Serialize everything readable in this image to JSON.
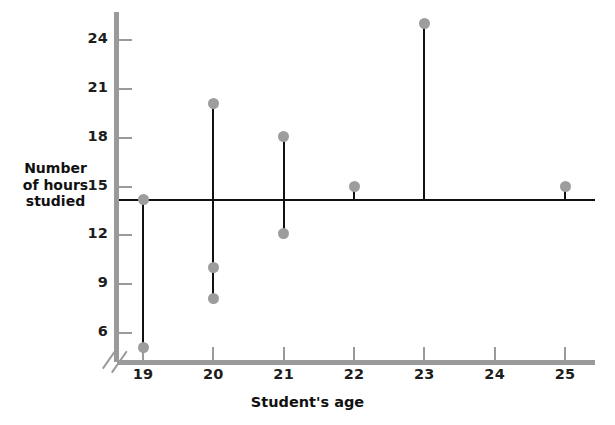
{
  "chart_data": {
    "type": "scatter",
    "title": "",
    "xlabel": "Student's age",
    "ylabel": "Number of hours studied",
    "ylabel_lines": [
      "Number",
      "of hours",
      "studied"
    ],
    "x": [
      19,
      20,
      21,
      22,
      23,
      24,
      25
    ],
    "xlim": [
      18.5,
      25.6
    ],
    "ylim": [
      4.2,
      26.0
    ],
    "y_ticks": [
      6,
      9,
      12,
      15,
      18,
      21,
      24
    ],
    "x_ticks": [
      19,
      20,
      21,
      22,
      23,
      24,
      25
    ],
    "grid": false,
    "legend": null,
    "axis_break": "y-axis broken between 0 and 4.2",
    "mean_line": {
      "label": "overall mean",
      "value": 14.25,
      "color": "#111111"
    },
    "marker_color": "#9d9d9d",
    "series": [
      {
        "name": "Hours studied by age",
        "points": [
          {
            "age": 19,
            "values": [
              14.2,
              5.1
            ]
          },
          {
            "age": 20,
            "values": [
              20.1,
              10.0,
              8.1
            ]
          },
          {
            "age": 21,
            "values": [
              18.1,
              12.1
            ]
          },
          {
            "age": 22,
            "values": [
              15.0
            ]
          },
          {
            "age": 23,
            "values": [
              25.0
            ]
          },
          {
            "age": 24,
            "values": []
          },
          {
            "age": 25,
            "values": [
              15.0
            ]
          }
        ]
      }
    ]
  }
}
